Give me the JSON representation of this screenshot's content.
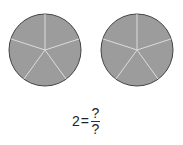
{
  "figure": {
    "circles": [
      {
        "cx": 45,
        "cy": 50,
        "r": 36,
        "parts": 5,
        "shaded": 5
      },
      {
        "cx": 137,
        "cy": 50,
        "r": 36,
        "parts": 5,
        "shaded": 5
      }
    ],
    "colors": {
      "fill": "#9c9c9c",
      "stroke": "#444444",
      "divider": "#dddddd"
    },
    "equation": {
      "whole": "2",
      "equals": "=",
      "numerator": "?",
      "denominator": "?"
    }
  }
}
